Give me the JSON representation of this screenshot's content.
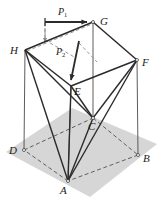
{
  "figure": {
    "background_color": "#ffffff",
    "base_fill": "#d4d4d4",
    "line_color": "#2b2b2b",
    "thin_line_color": "#555555",
    "dashed_color": "#6e6e6e",
    "vertices": [
      {
        "id": "H",
        "label": "H",
        "x": 25,
        "y": 50,
        "label_x": 12,
        "label_y": 50,
        "kind": "top"
      },
      {
        "id": "G",
        "label": "G",
        "x": 93,
        "y": 22,
        "label_x": 100,
        "label_y": 22,
        "kind": "top"
      },
      {
        "id": "F",
        "label": "F",
        "x": 137,
        "y": 60,
        "label_x": 143,
        "label_y": 63,
        "kind": "top"
      },
      {
        "id": "E",
        "label": "E",
        "x": 71,
        "y": 86,
        "label_x": 76,
        "label_y": 92,
        "kind": "top"
      },
      {
        "id": "D",
        "label": "D",
        "x": 24,
        "y": 150,
        "label_x": 12,
        "label_y": 150,
        "kind": "base"
      },
      {
        "id": "C",
        "label": "C",
        "x": 93,
        "y": 118,
        "label_x": 90,
        "label_y": 128,
        "kind": "base"
      },
      {
        "id": "B",
        "label": "B",
        "x": 138,
        "y": 155,
        "label_x": 144,
        "label_y": 159,
        "kind": "base"
      },
      {
        "id": "A",
        "label": "A",
        "x": 68,
        "y": 181,
        "label_x": 60,
        "label_y": 192,
        "kind": "base"
      }
    ],
    "forces": [
      {
        "id": "P1",
        "label": "P",
        "subscript": "1",
        "label_x": 58,
        "label_y": 14,
        "from_x": 45,
        "from_y": 22,
        "to_x": 91,
        "to_y": 22,
        "direction": "right"
      },
      {
        "id": "P2",
        "label": "P",
        "subscript": "2",
        "label_x": 58,
        "label_y": 54,
        "from_x": 79,
        "from_y": 41,
        "to_x": 70,
        "to_y": 84,
        "direction": "down-left"
      }
    ],
    "edges_solid_thick": [
      {
        "from": "A",
        "to": "H"
      },
      {
        "from": "A",
        "to": "E"
      },
      {
        "from": "A",
        "to": "C"
      },
      {
        "from": "A",
        "to": "F"
      },
      {
        "from": "H",
        "to": "E"
      },
      {
        "from": "E",
        "to": "F"
      },
      {
        "from": "E",
        "to": "C"
      },
      {
        "from": "C",
        "to": "F"
      },
      {
        "from": "H",
        "to": "G"
      },
      {
        "from": "G",
        "to": "F"
      },
      {
        "from": "H",
        "to": "C"
      }
    ],
    "edges_thin_vertical": [
      {
        "from": "H",
        "to": "D"
      },
      {
        "from": "E",
        "to": "A"
      },
      {
        "from": "G",
        "to": "C"
      },
      {
        "from": "F",
        "to": "B"
      }
    ],
    "edges_dashed": [
      {
        "from": "D",
        "to": "C"
      },
      {
        "from": "D",
        "to": "A"
      },
      {
        "from": "A",
        "to": "B"
      },
      {
        "from": "B",
        "to": "C"
      },
      {
        "from": "H",
        "to": "G"
      }
    ],
    "base_polygon": "D,C,B,A",
    "shadow_note": "light gray ground plane quadrilateral"
  }
}
